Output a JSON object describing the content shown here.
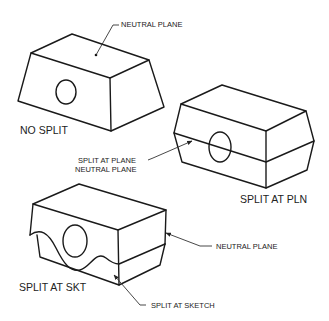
{
  "diagram": {
    "type": "draft split illustrations",
    "figures": [
      {
        "id": "no-split",
        "caption": "NO SPLIT",
        "callouts": [
          "NEUTRAL PLANE"
        ]
      },
      {
        "id": "split-at-pln",
        "caption": "SPLIT AT PLN",
        "callouts": [
          "SPLIT AT PLANE",
          "NEUTRAL PLANE"
        ]
      },
      {
        "id": "split-at-skt",
        "caption": "SPLIT AT SKT",
        "callouts": [
          "NEUTRAL PLANE",
          "SPLIT AT SKETCH"
        ]
      }
    ]
  },
  "labels": {
    "neutral_plane_top": "NEUTRAL PLANE",
    "no_split": "NO SPLIT",
    "split_at_plane": "SPLIT AT PLANE",
    "neutral_plane_mid": "NEUTRAL PLANE",
    "split_at_pln": "SPLIT AT PLN",
    "neutral_plane_bottom": "NEUTRAL PLANE",
    "split_at_skt": "SPLIT AT SKT",
    "split_at_sketch": "SPLIT AT SKETCH"
  },
  "colors": {
    "line": "#1a1a1a",
    "background": "#ffffff"
  }
}
